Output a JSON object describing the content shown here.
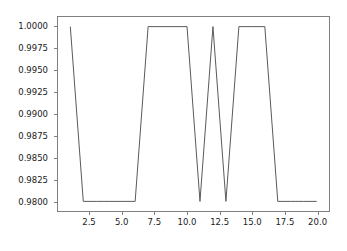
{
  "chart_data": {
    "type": "line",
    "title": "",
    "xlabel": "",
    "ylabel": "",
    "xlim": [
      0.05,
      20.95
    ],
    "ylim": [
      0.9789,
      1.0011
    ],
    "grid": false,
    "legend": null,
    "line_color": "#5a5a5a",
    "line_width": 1,
    "x": [
      1,
      2,
      3,
      4,
      5,
      6,
      7,
      8,
      9,
      10,
      11,
      12,
      13,
      14,
      15,
      16,
      17,
      18,
      19,
      20
    ],
    "values": [
      1.0,
      0.98,
      0.98,
      0.98,
      0.98,
      0.98,
      1.0,
      1.0,
      1.0,
      1.0,
      0.98,
      1.0,
      0.98,
      1.0,
      1.0,
      1.0,
      0.98,
      0.98,
      0.98,
      0.98
    ],
    "series": [
      {
        "name": "accuracy",
        "x": [
          1,
          2,
          3,
          4,
          5,
          6,
          7,
          8,
          9,
          10,
          11,
          12,
          13,
          14,
          15,
          16,
          17,
          18,
          19,
          20
        ],
        "values": [
          1.0,
          0.98,
          0.98,
          0.98,
          0.98,
          0.98,
          1.0,
          1.0,
          1.0,
          1.0,
          0.98,
          1.0,
          0.98,
          1.0,
          1.0,
          1.0,
          0.98,
          0.98,
          0.98,
          0.98
        ]
      }
    ],
    "yticks": [
      0.98,
      0.9825,
      0.985,
      0.9875,
      0.99,
      0.9925,
      0.995,
      0.9975,
      1.0
    ],
    "ytick_labels": [
      "0.9800",
      "0.9825",
      "0.9850",
      "0.9875",
      "0.9900",
      "0.9925",
      "0.9950",
      "0.9975",
      "1.0000"
    ],
    "xticks": [
      2.5,
      5.0,
      7.5,
      10.0,
      12.5,
      15.0,
      17.5,
      20.0
    ],
    "xtick_labels": [
      "2.5",
      "5.0",
      "7.5",
      "10.0",
      "12.5",
      "15.0",
      "17.5",
      "20.0"
    ],
    "axes_color": "#808080",
    "background_color": "#ffffff",
    "tick_label_color": "#1a1a1a"
  }
}
